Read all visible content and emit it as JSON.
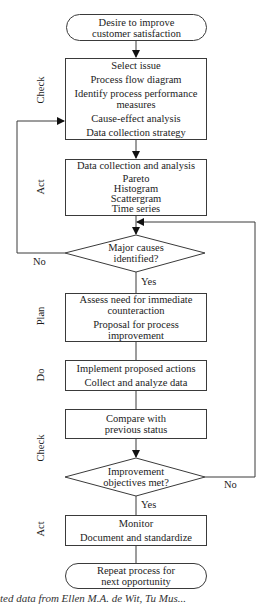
{
  "diagram": {
    "type": "flowchart",
    "start": {
      "lines": [
        "Desire to improve",
        "customer satisfaction"
      ]
    },
    "steps": [
      {
        "phase": "Check",
        "items": [
          "Select issue",
          "Process flow diagram",
          "Identify process performance measures",
          "Cause-effect analysis",
          "Data collection strategy"
        ],
        "display_lines": [
          "Select issue",
          "Process flow diagram",
          "Identify process performance",
          "measures",
          "Cause-effect analysis",
          "Data collection strategy"
        ]
      },
      {
        "phase": "Act",
        "items": [
          "Data collection and analysis",
          "Pareto",
          "Histogram",
          "Scattergram",
          "Time series"
        ]
      },
      {
        "phase": "",
        "decision": "Major causes identified?",
        "display_lines": [
          "Major causes",
          "identified?"
        ],
        "yes_label": "Yes",
        "no_label": "No",
        "no_target": "Select issue box (Check)"
      },
      {
        "phase": "Plan",
        "items": [
          "Assess need for immediate counteraction",
          "Proposal for process improvement"
        ],
        "display_lines": [
          "Assess need for immediate",
          "counteraction",
          "Proposal for process",
          "improvement"
        ]
      },
      {
        "phase": "Do",
        "items": [
          "Implement proposed actions",
          "Collect and analyze data"
        ]
      },
      {
        "phase": "Check",
        "items": [
          "Compare with previous status"
        ],
        "display_lines": [
          "Compare with",
          "previous status"
        ]
      },
      {
        "phase": "",
        "decision": "Improvement objectives met?",
        "display_lines": [
          "Improvement",
          "objectives met?"
        ],
        "yes_label": "Yes",
        "no_label": "No",
        "no_target": "Major causes identified? decision"
      },
      {
        "phase": "Act",
        "items": [
          "Monitor",
          "Document and standardize"
        ]
      }
    ],
    "end": {
      "lines": [
        "Repeat process for",
        "next opportunity"
      ]
    },
    "phase_labels": {
      "check1": "Check",
      "act1": "Act",
      "plan": "Plan",
      "do": "Do",
      "check2": "Check",
      "act2": "Act"
    },
    "edge_labels": {
      "d1_no": "No",
      "d1_yes": "Yes",
      "d2_no": "No",
      "d2_yes": "Yes"
    },
    "caption_partial": "ted data from Ellen M.A. de Wit, Tu Mus..."
  }
}
